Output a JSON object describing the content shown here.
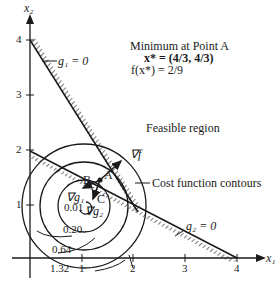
{
  "figure": {
    "axes": {
      "x_label": "x₁",
      "y_label": "x₂",
      "x_ticks": [
        "1",
        "2",
        "3",
        "4"
      ],
      "y_ticks": [
        "1",
        "2",
        "3",
        "4"
      ]
    },
    "constraints": {
      "g1": "g₁ = 0",
      "g2": "g₂ = 0"
    },
    "annotation": {
      "title": "Minimum at Point A",
      "x_star": "x* = (4/3, 4/3)",
      "f_star": "f(x*) = 2/9"
    },
    "labels": {
      "feasible_region": "Feasible region",
      "cost_contours": "Cost function contours",
      "grad_f": "∇f",
      "grad_g1": "∇g₁",
      "grad_g2": "∇g₂",
      "point_a": "A",
      "point_b": "B",
      "point_c": "C"
    },
    "contours": [
      "0.01",
      "0.20",
      "0.64",
      "1.32"
    ],
    "colors": {
      "ink": "#1a1a1a",
      "background": "#ffffff"
    }
  }
}
